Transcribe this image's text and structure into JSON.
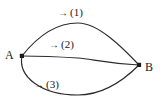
{
  "figure": {
    "type": "diagram",
    "background_color": "#ffffff",
    "stroke_color": "#2b2b2b",
    "text_color": "#1a1a1a",
    "width": 162,
    "height": 105
  },
  "nodes": [
    {
      "id": "A",
      "label": "A",
      "x": 22,
      "y": 56
    },
    {
      "id": "B",
      "label": "B",
      "x": 139,
      "y": 65
    }
  ],
  "paths": [
    {
      "id": "1",
      "label": "(1)",
      "arrow": "→",
      "direction": "rightward",
      "description": "upper arc bulging above the A-B chord, peak near (78, 23)"
    },
    {
      "id": "2",
      "label": "(2)",
      "arrow": "→",
      "direction": "rightward",
      "description": "nearly straight middle path with a slight step down near midpoint"
    },
    {
      "id": "3",
      "label": "(3)",
      "arrow": "→",
      "direction": "rightward",
      "description": "lower arc bulging below the A-B chord, trough near (78, 95)"
    }
  ],
  "geometry": {
    "curve_1": "M22,56 C40,33 58,23 78,23 C98,23 122,47 139,65",
    "curve_2": "M22,56 C42,56 62,57 78,58 C92,59 104,63 139,65",
    "curve_3": "M22,56 C18,76 40,95 78,95 C104,95 126,78 139,65"
  }
}
